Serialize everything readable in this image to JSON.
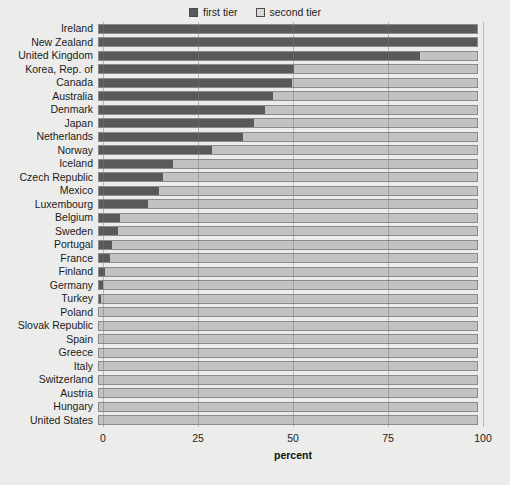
{
  "legend": {
    "position": "top-center",
    "entries": [
      {
        "label": "first tier",
        "swatch": "legend-swatch-first-tier",
        "color": "#595959"
      },
      {
        "label": "second tier",
        "swatch": "legend-swatch-second-tier",
        "color": "#c2c2c2"
      }
    ]
  },
  "axis": {
    "title": "percent",
    "ticks": [
      "0",
      "25",
      "50",
      "75",
      "100"
    ]
  },
  "chart_data": {
    "type": "bar",
    "orientation": "horizontal",
    "stacked": true,
    "title": "",
    "subtitle": "",
    "xlabel": "percent",
    "ylabel": "",
    "xlim": [
      0,
      100
    ],
    "xticks": [
      0,
      25,
      50,
      75,
      100
    ],
    "grid": true,
    "legend_position": "top-center",
    "categories": [
      "Ireland",
      "New Zealand",
      "United Kingdom",
      "Korea, Rep. of",
      "Canada",
      "Australia",
      "Denmark",
      "Japan",
      "Netherlands",
      "Norway",
      "Iceland",
      "Czech Republic",
      "Mexico",
      "Luxembourg",
      "Belgium",
      "Sweden",
      "Portugal",
      "France",
      "Finland",
      "Germany",
      "Turkey",
      "Poland",
      "Slovak Republic",
      "Spain",
      "Greece",
      "Italy",
      "Switzerland",
      "Austria",
      "Hungary",
      "United States"
    ],
    "series": [
      {
        "name": "first tier",
        "color": "#595959",
        "values": [
          100,
          100,
          85,
          51.5,
          51,
          46,
          44,
          41,
          38,
          30,
          19.5,
          17,
          16,
          13,
          5.5,
          5,
          3.5,
          3,
          1.5,
          1,
          0.5,
          0,
          0,
          0,
          0,
          0,
          0,
          0,
          0,
          0
        ]
      },
      {
        "name": "second tier",
        "color": "#c2c2c2",
        "values": [
          0,
          0,
          15,
          48.5,
          49,
          54,
          56,
          59,
          62,
          70,
          80.5,
          83,
          84,
          87,
          94.5,
          95,
          96.5,
          97,
          98.5,
          99,
          99.5,
          100,
          100,
          100,
          100,
          100,
          100,
          100,
          100,
          100
        ]
      }
    ]
  }
}
